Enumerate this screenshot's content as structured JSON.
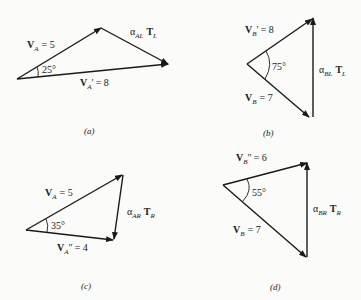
{
  "diagrams": [
    {
      "id": "a",
      "caption": "(a)",
      "angle": "25°",
      "vec1": {
        "sym": "V",
        "sub": "A",
        "prime": "",
        "value": "= 5"
      },
      "vec2": {
        "sym": "V",
        "sub": "A",
        "prime": "′",
        "value": "= 8"
      },
      "diff": {
        "alpha_sub": "AL",
        "T_sub": "L"
      }
    },
    {
      "id": "b",
      "caption": "(b)",
      "angle": "75°",
      "vec1": {
        "sym": "V",
        "sub": "B",
        "prime": "′",
        "value": "= 8"
      },
      "vec2": {
        "sym": "V",
        "sub": "B",
        "prime": "",
        "value": "= 7"
      },
      "diff": {
        "alpha_sub": "BL",
        "T_sub": "L"
      }
    },
    {
      "id": "c",
      "caption": "(c)",
      "angle": "35°",
      "vec1": {
        "sym": "V",
        "sub": "A",
        "prime": "",
        "value": "= 5"
      },
      "vec2": {
        "sym": "V",
        "sub": "A",
        "prime": "″",
        "value": "= 4"
      },
      "diff": {
        "alpha_sub": "AR",
        "T_sub": "R"
      }
    },
    {
      "id": "d",
      "caption": "(d)",
      "angle": "55°",
      "vec1": {
        "sym": "V",
        "sub": "B",
        "prime": "″",
        "value": "= 6"
      },
      "vec2": {
        "sym": "V",
        "sub": "B",
        "prime": "",
        "value": "= 7"
      },
      "diff": {
        "alpha_sub": "BR",
        "T_sub": "R"
      }
    }
  ],
  "alpha": "α",
  "T": "T"
}
